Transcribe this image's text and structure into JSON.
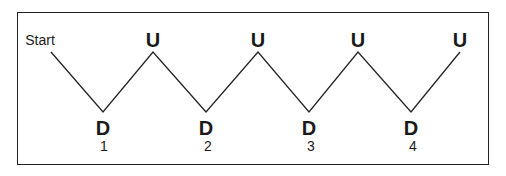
{
  "diagram": {
    "start_label": "Start",
    "peak_label": "U",
    "trough_label": "D",
    "points": [
      {
        "type": "start",
        "x": 51,
        "y": 52
      },
      {
        "type": "D",
        "x": 103,
        "y": 112
      },
      {
        "type": "U",
        "x": 153,
        "y": 52
      },
      {
        "type": "D",
        "x": 206,
        "y": 112
      },
      {
        "type": "U",
        "x": 258,
        "y": 52
      },
      {
        "type": "D",
        "x": 309,
        "y": 112
      },
      {
        "type": "U",
        "x": 358,
        "y": 52
      },
      {
        "type": "D",
        "x": 411,
        "y": 112
      },
      {
        "type": "U",
        "x": 460,
        "y": 52
      }
    ],
    "peaks": [
      {
        "label": "U",
        "x": 153
      },
      {
        "label": "U",
        "x": 258
      },
      {
        "label": "U",
        "x": 358
      },
      {
        "label": "U",
        "x": 460
      }
    ],
    "troughs": [
      {
        "label": "D",
        "number": "1",
        "x": 103
      },
      {
        "label": "D",
        "number": "2",
        "x": 206
      },
      {
        "label": "D",
        "number": "3",
        "x": 309
      },
      {
        "label": "D",
        "number": "4",
        "x": 411
      }
    ],
    "line_color": "#222222"
  }
}
